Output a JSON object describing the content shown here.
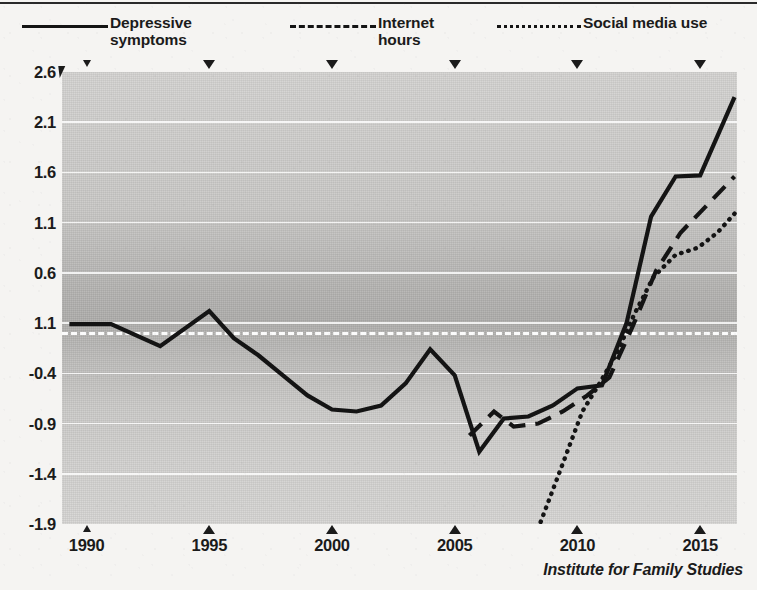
{
  "credit": "Institute for Family Studies",
  "legend": {
    "entries": [
      {
        "label": "Depressive\nsymptoms",
        "style": "solid",
        "icon": "solid-line-icon"
      },
      {
        "label": "Internet\nhours",
        "style": "dashed",
        "icon": "dashed-line-icon"
      },
      {
        "label": "Social media use",
        "style": "dotted",
        "icon": "dotted-line-icon"
      }
    ]
  },
  "chart_data": {
    "type": "line",
    "title": "",
    "subtitle": "",
    "xlabel": "",
    "ylabel": "",
    "xlim": [
      1989,
      2016.5
    ],
    "ylim": [
      -1.9,
      2.6
    ],
    "grid": true,
    "legend_position": "top",
    "zero_reference_line": 0.0,
    "x_ticks": [
      1990,
      1995,
      2000,
      2005,
      2010,
      2015
    ],
    "x_tick_labels": [
      "1990",
      "1995",
      "2000",
      "2005",
      "2010",
      "2015"
    ],
    "y_ticks": [
      2.6,
      2.1,
      1.6,
      1.1,
      0.6,
      0.1,
      -0.4,
      -0.9,
      -1.4,
      -1.9
    ],
    "y_tick_labels": [
      "2.6",
      "2.1",
      "1.6",
      "1.1",
      "0.6",
      "1.1",
      "-0.4",
      "-0.9",
      "-1.4",
      "-1.9"
    ],
    "series": [
      {
        "name": "Depressive symptoms",
        "style": "solid",
        "color": "#141414",
        "x": [
          1989.3,
          1991,
          1993,
          1995,
          1996,
          1997,
          1998,
          1999,
          2000,
          2001,
          2002,
          2003,
          2004,
          2005,
          2006,
          2007,
          2008,
          2009,
          2010,
          2011,
          2012,
          2013,
          2014,
          2015,
          2016.4
        ],
        "y": [
          0.09,
          0.09,
          -0.13,
          0.22,
          -0.05,
          -0.22,
          -0.42,
          -0.62,
          -0.76,
          -0.78,
          -0.72,
          -0.5,
          -0.16,
          -0.42,
          -1.18,
          -0.85,
          -0.83,
          -0.72,
          -0.55,
          -0.52,
          0.1,
          1.16,
          1.56,
          1.57,
          2.35
        ]
      },
      {
        "name": "Internet hours",
        "style": "dashed",
        "color": "#141414",
        "x": [
          2005.6,
          2006.6,
          2007.4,
          2008.4,
          2009.4,
          2010.4,
          2011.3,
          2012.2,
          2013.2,
          2014.2,
          2015.3,
          2016.4
        ],
        "y": [
          -1.02,
          -0.78,
          -0.93,
          -0.9,
          -0.78,
          -0.62,
          -0.44,
          0.04,
          0.62,
          1.0,
          1.28,
          1.56
        ]
      },
      {
        "name": "Social media use",
        "style": "dotted",
        "color": "#141414",
        "x": [
          2008.5,
          2009.4,
          2010.2,
          2010.9,
          2011.6,
          2012.3,
          2013.1,
          2014.0,
          2014.9,
          2015.7,
          2016.4
        ],
        "y": [
          -1.88,
          -1.3,
          -0.78,
          -0.5,
          -0.2,
          0.18,
          0.56,
          0.78,
          0.85,
          1.0,
          1.19
        ]
      }
    ]
  }
}
